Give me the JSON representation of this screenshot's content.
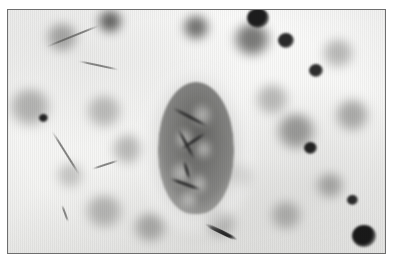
{
  "figure": {
    "kind": "photomicrograph",
    "modality": "light-microscopy",
    "stain_appearance": "grayscale",
    "title": "",
    "caption": "",
    "background_color": "#ffffff",
    "field_color": "#f6f6f4",
    "border_color": "#6e6e6e",
    "dark_nucleus_color": "#232323",
    "soft_blob_color": "#8f8f8d",
    "cyst_color": "#6b6b69",
    "septum_color": "#2e2e2e"
  },
  "frame": {
    "left": 7,
    "top": 9,
    "width": 379,
    "height": 245,
    "border_px": 1
  },
  "specimen": {
    "central_body": {
      "label": "oval-cyst",
      "cx": 196,
      "cy": 148,
      "rx": 38,
      "ry": 66,
      "halo": true,
      "internal_septa": 5,
      "vacuoles": 6
    },
    "soft_blobs": [
      {
        "x": 62,
        "y": 38,
        "w": 34,
        "h": 30,
        "tone": "#7a7a78",
        "a": 0.62
      },
      {
        "x": 110,
        "y": 22,
        "w": 26,
        "h": 24,
        "tone": "#3c3c3a",
        "a": 0.78
      },
      {
        "x": 196,
        "y": 28,
        "w": 28,
        "h": 26,
        "tone": "#454543",
        "a": 0.74
      },
      {
        "x": 252,
        "y": 40,
        "w": 40,
        "h": 34,
        "tone": "#4a4a48",
        "a": 0.72
      },
      {
        "x": 30,
        "y": 108,
        "w": 44,
        "h": 40,
        "tone": "#8a8a88",
        "a": 0.6
      },
      {
        "x": 104,
        "y": 112,
        "w": 38,
        "h": 34,
        "tone": "#8f8f8d",
        "a": 0.55
      },
      {
        "x": 128,
        "y": 150,
        "w": 34,
        "h": 32,
        "tone": "#8c8c8a",
        "a": 0.55
      },
      {
        "x": 272,
        "y": 100,
        "w": 36,
        "h": 32,
        "tone": "#8d8d8b",
        "a": 0.56
      },
      {
        "x": 296,
        "y": 132,
        "w": 42,
        "h": 38,
        "tone": "#6e6e6c",
        "a": 0.66
      },
      {
        "x": 338,
        "y": 54,
        "w": 34,
        "h": 30,
        "tone": "#8b8b89",
        "a": 0.56
      },
      {
        "x": 352,
        "y": 116,
        "w": 36,
        "h": 34,
        "tone": "#7c7c7a",
        "a": 0.6
      },
      {
        "x": 104,
        "y": 212,
        "w": 42,
        "h": 34,
        "tone": "#8d8d8b",
        "a": 0.58
      },
      {
        "x": 150,
        "y": 228,
        "w": 36,
        "h": 30,
        "tone": "#7f7f7d",
        "a": 0.6
      },
      {
        "x": 220,
        "y": 224,
        "w": 34,
        "h": 28,
        "tone": "#8a8a88",
        "a": 0.56
      },
      {
        "x": 286,
        "y": 216,
        "w": 34,
        "h": 30,
        "tone": "#858583",
        "a": 0.58
      },
      {
        "x": 70,
        "y": 176,
        "w": 30,
        "h": 26,
        "tone": "#9a9a98",
        "a": 0.5
      },
      {
        "x": 240,
        "y": 176,
        "w": 26,
        "h": 24,
        "tone": "#9a9a98",
        "a": 0.48
      },
      {
        "x": 330,
        "y": 186,
        "w": 30,
        "h": 26,
        "tone": "#77777 5",
        "a": 0.58
      }
    ],
    "dark_nuclei": [
      {
        "x": 258,
        "y": 18,
        "w": 22,
        "h": 20,
        "tone": "#1d1d1d"
      },
      {
        "x": 286,
        "y": 40,
        "w": 16,
        "h": 15,
        "tone": "#2a2a2a"
      },
      {
        "x": 43,
        "y": 118,
        "w": 9,
        "h": 8,
        "tone": "#232323"
      },
      {
        "x": 316,
        "y": 70,
        "w": 14,
        "h": 13,
        "tone": "#2d2d2d"
      },
      {
        "x": 310,
        "y": 148,
        "w": 13,
        "h": 12,
        "tone": "#232323"
      },
      {
        "x": 364,
        "y": 236,
        "w": 24,
        "h": 22,
        "tone": "#1a1a1a"
      },
      {
        "x": 352,
        "y": 200,
        "w": 11,
        "h": 10,
        "tone": "#2b2b2b"
      }
    ],
    "filaments": [
      {
        "x": 46,
        "y": 46,
        "len": 58,
        "rot": -22,
        "thick": 2
      },
      {
        "x": 78,
        "y": 60,
        "len": 42,
        "rot": 12,
        "thick": 2
      },
      {
        "x": 52,
        "y": 130,
        "len": 52,
        "rot": 58,
        "thick": 2
      },
      {
        "x": 92,
        "y": 168,
        "len": 28,
        "rot": -18,
        "thick": 2
      },
      {
        "x": 62,
        "y": 204,
        "len": 18,
        "rot": 70,
        "thick": 2
      },
      {
        "x": 205,
        "y": 222,
        "len": 36,
        "rot": 26,
        "thick": 4
      }
    ]
  }
}
